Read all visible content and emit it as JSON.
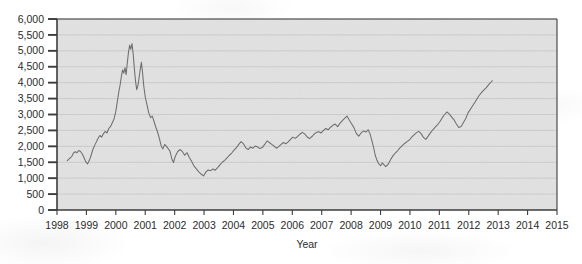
{
  "chart_data": {
    "type": "line",
    "title": "",
    "subtitle": "",
    "xlabel": "Year",
    "ylabel": "",
    "grid": true,
    "legend": false,
    "legend_position": "none",
    "xlim": [
      1998,
      2015
    ],
    "ylim": [
      0,
      6000
    ],
    "xticks": [
      1998,
      1999,
      2000,
      2001,
      2002,
      2003,
      2004,
      2005,
      2006,
      2007,
      2008,
      2009,
      2010,
      2011,
      2012,
      2013,
      2014,
      2015
    ],
    "xtick_labels": [
      "1998",
      "1999",
      "2000",
      "2001",
      "2002",
      "2003",
      "2004",
      "2005",
      "2006",
      "2007",
      "2008",
      "2009",
      "2010",
      "2011",
      "2012",
      "2013",
      "2014",
      "2015"
    ],
    "yticks": [
      0,
      500,
      1000,
      1500,
      2000,
      2500,
      3000,
      3500,
      4000,
      4500,
      5000,
      5500,
      6000
    ],
    "ytick_labels": [
      "0",
      "500",
      "1,000",
      "1,500",
      "2,000",
      "2,500",
      "3,000",
      "3,500",
      "4,000",
      "4,500",
      "5,000",
      "5,500",
      "6,000"
    ],
    "line_color": "#6e6e6e",
    "plot_background": "#e9e9e9",
    "grid_color": "#c8c8c8",
    "axis_color": "#3c3c3c",
    "series": [
      {
        "name": "Index",
        "x": [
          1998.35,
          1998.43,
          1998.5,
          1998.56,
          1998.62,
          1998.68,
          1998.74,
          1998.8,
          1998.86,
          1998.92,
          1998.98,
          1999.04,
          1999.1,
          1999.16,
          1999.22,
          1999.28,
          1999.34,
          1999.4,
          1999.46,
          1999.52,
          1999.58,
          1999.64,
          1999.7,
          1999.76,
          1999.82,
          1999.88,
          1999.94,
          2000.0,
          2000.05,
          2000.1,
          2000.15,
          2000.19,
          2000.23,
          2000.27,
          2000.31,
          2000.35,
          2000.39,
          2000.43,
          2000.47,
          2000.51,
          2000.55,
          2000.59,
          2000.63,
          2000.67,
          2000.71,
          2000.75,
          2000.79,
          2000.83,
          2000.87,
          2000.91,
          2000.95,
          2001.0,
          2001.06,
          2001.12,
          2001.18,
          2001.24,
          2001.3,
          2001.36,
          2001.42,
          2001.48,
          2001.54,
          2001.6,
          2001.66,
          2001.72,
          2001.78,
          2001.84,
          2001.9,
          2001.96,
          2002.02,
          2002.1,
          2002.18,
          2002.26,
          2002.34,
          2002.42,
          2002.5,
          2002.58,
          2002.66,
          2002.74,
          2002.82,
          2002.9,
          2002.98,
          2003.06,
          2003.14,
          2003.22,
          2003.3,
          2003.38,
          2003.46,
          2003.54,
          2003.62,
          2003.7,
          2003.78,
          2003.86,
          2003.94,
          2004.02,
          2004.1,
          2004.18,
          2004.26,
          2004.34,
          2004.42,
          2004.5,
          2004.58,
          2004.66,
          2004.74,
          2004.82,
          2004.9,
          2004.98,
          2005.06,
          2005.14,
          2005.22,
          2005.3,
          2005.38,
          2005.46,
          2005.54,
          2005.62,
          2005.7,
          2005.78,
          2005.86,
          2005.94,
          2006.02,
          2006.1,
          2006.18,
          2006.26,
          2006.34,
          2006.42,
          2006.5,
          2006.58,
          2006.66,
          2006.74,
          2006.82,
          2006.9,
          2006.98,
          2007.06,
          2007.14,
          2007.22,
          2007.3,
          2007.38,
          2007.46,
          2007.54,
          2007.62,
          2007.7,
          2007.78,
          2007.86,
          2007.94,
          2008.02,
          2008.1,
          2008.18,
          2008.26,
          2008.34,
          2008.42,
          2008.5,
          2008.58,
          2008.64,
          2008.7,
          2008.76,
          2008.82,
          2008.88,
          2008.94,
          2009.0,
          2009.06,
          2009.12,
          2009.18,
          2009.26,
          2009.34,
          2009.42,
          2009.5,
          2009.58,
          2009.66,
          2009.74,
          2009.82,
          2009.9,
          2009.98,
          2010.06,
          2010.14,
          2010.22,
          2010.3,
          2010.38,
          2010.46,
          2010.54,
          2010.62,
          2010.7,
          2010.78,
          2010.86,
          2010.94,
          2011.02,
          2011.1,
          2011.18,
          2011.26,
          2011.34,
          2011.42,
          2011.5,
          2011.58,
          2011.66,
          2011.74,
          2011.82,
          2011.9,
          2011.98,
          2012.1,
          2012.22,
          2012.34,
          2012.46,
          2012.58,
          2012.7,
          2012.8
        ],
        "values": [
          1550,
          1620,
          1680,
          1790,
          1830,
          1800,
          1870,
          1840,
          1760,
          1640,
          1510,
          1450,
          1560,
          1720,
          1900,
          2030,
          2140,
          2260,
          2340,
          2290,
          2400,
          2470,
          2420,
          2560,
          2620,
          2740,
          2860,
          3100,
          3400,
          3700,
          3950,
          4200,
          4400,
          4300,
          4470,
          4250,
          4620,
          4950,
          5180,
          5050,
          5230,
          4900,
          4450,
          4050,
          3780,
          3900,
          4150,
          4420,
          4640,
          4300,
          3900,
          3550,
          3300,
          3050,
          2900,
          2950,
          2780,
          2600,
          2450,
          2250,
          2020,
          1920,
          2060,
          2000,
          1930,
          1850,
          1620,
          1490,
          1680,
          1830,
          1900,
          1840,
          1720,
          1800,
          1650,
          1520,
          1380,
          1290,
          1200,
          1130,
          1070,
          1190,
          1260,
          1230,
          1290,
          1250,
          1330,
          1420,
          1500,
          1560,
          1640,
          1720,
          1790,
          1880,
          1960,
          2060,
          2150,
          2080,
          1950,
          1900,
          1980,
          1940,
          2010,
          1980,
          1930,
          1960,
          2060,
          2170,
          2120,
          2060,
          2010,
          1940,
          1990,
          2060,
          2120,
          2080,
          2140,
          2220,
          2290,
          2250,
          2310,
          2380,
          2440,
          2390,
          2300,
          2240,
          2300,
          2380,
          2440,
          2460,
          2420,
          2500,
          2560,
          2520,
          2600,
          2660,
          2700,
          2620,
          2720,
          2810,
          2880,
          2950,
          2820,
          2700,
          2580,
          2400,
          2320,
          2420,
          2480,
          2450,
          2520,
          2400,
          2200,
          1980,
          1720,
          1560,
          1450,
          1390,
          1480,
          1420,
          1360,
          1440,
          1580,
          1700,
          1790,
          1860,
          1950,
          2020,
          2090,
          2150,
          2200,
          2290,
          2360,
          2430,
          2470,
          2400,
          2280,
          2220,
          2320,
          2430,
          2520,
          2600,
          2680,
          2780,
          2900,
          3000,
          3080,
          3010,
          2920,
          2830,
          2700,
          2590,
          2620,
          2750,
          2880,
          3060,
          3230,
          3400,
          3580,
          3720,
          3830,
          3960,
          4060
        ]
      }
    ],
    "annotations": []
  }
}
